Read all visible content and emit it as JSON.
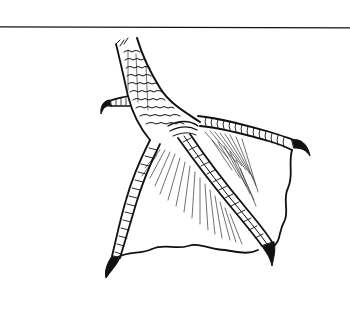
{
  "figure": {
    "subject": "webbed bird foot line drawing",
    "style": "black ink line art",
    "colors": {
      "ink": "#111111",
      "background": "#ffffff",
      "hatch": "#333333"
    },
    "parts": {
      "rule": "horizontal rule",
      "tarsus": "scaled leg",
      "hind_toe": "hind toe with claw",
      "left_toe": "left toe with claw",
      "middle_toe": "middle toe with claw",
      "right_toe": "right toe with claw",
      "web_left": "web between left and middle toes",
      "web_right": "web between middle and right toes"
    }
  }
}
